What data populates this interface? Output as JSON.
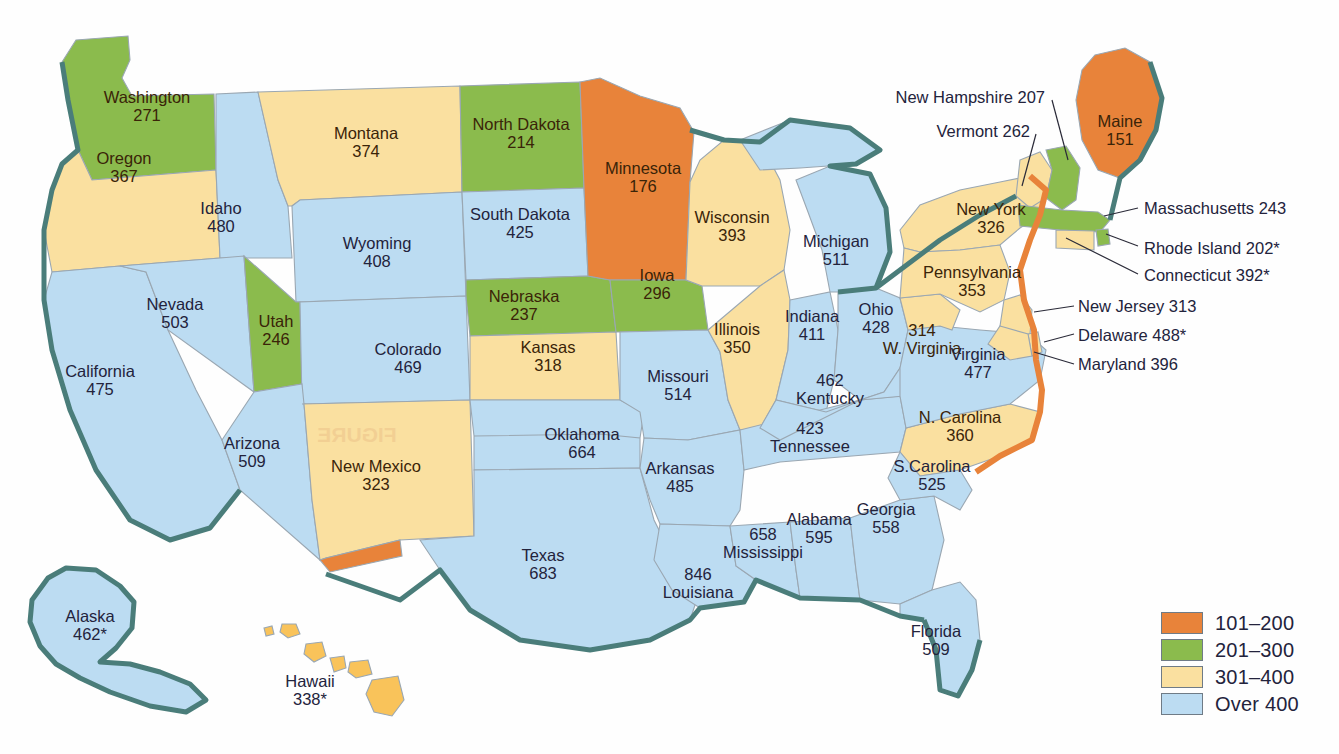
{
  "chart_data": {
    "type": "heatmap",
    "title": "",
    "subtitle": "",
    "map_region": "United States",
    "legend": {
      "position": "bottom-right",
      "bins": [
        {
          "label": "101–200",
          "color": "#e8833a",
          "min": 101,
          "max": 200
        },
        {
          "label": "201–300",
          "color": "#8bbb4d",
          "min": 201,
          "max": 300
        },
        {
          "label": "301–400",
          "color": "#fae0a0",
          "min": 301,
          "max": 400
        },
        {
          "label": "Over 400",
          "color": "#bcdcf2",
          "min": 401,
          "max": null
        }
      ]
    },
    "categories": [
      "Washington",
      "Oregon",
      "Idaho",
      "Montana",
      "North Dakota",
      "Minnesota",
      "Wisconsin",
      "Michigan",
      "South Dakota",
      "Wyoming",
      "Nebraska",
      "Iowa",
      "Illinois",
      "Indiana",
      "Ohio",
      "Nevada",
      "Utah",
      "Colorado",
      "Kansas",
      "Missouri",
      "Kentucky",
      "W. Virginia",
      "Virginia",
      "California",
      "Arizona",
      "New Mexico",
      "Oklahoma",
      "Arkansas",
      "Tennessee",
      "N. Carolina",
      "S.Carolina",
      "Texas",
      "Louisiana",
      "Mississippi",
      "Alabama",
      "Georgia",
      "Florida",
      "New York",
      "Pennsylvania",
      "Maine",
      "Vermont",
      "New Hampshire",
      "Massachusetts",
      "Rhode Island",
      "Connecticut",
      "New Jersey",
      "Delaware",
      "Maryland",
      "Alaska",
      "Hawaii"
    ],
    "values": [
      271,
      367,
      480,
      374,
      214,
      176,
      393,
      511,
      425,
      408,
      237,
      296,
      350,
      411,
      428,
      503,
      246,
      469,
      318,
      514,
      462,
      314,
      477,
      475,
      509,
      323,
      664,
      485,
      423,
      360,
      525,
      683,
      846,
      658,
      595,
      558,
      509,
      326,
      353,
      151,
      262,
      207,
      243,
      202,
      392,
      313,
      488,
      396,
      462,
      338
    ]
  },
  "states": [
    {
      "name": "Washington",
      "value": "271",
      "bin": "201-300",
      "label_x": 147,
      "label_y": 106,
      "dark": true
    },
    {
      "name": "Oregon",
      "value": "367",
      "bin": "301-400",
      "label_x": 124,
      "label_y": 167,
      "dark": true
    },
    {
      "name": "Idaho",
      "value": "480",
      "bin": "over400",
      "label_x": 221,
      "label_y": 217
    },
    {
      "name": "Montana",
      "value": "374",
      "bin": "301-400",
      "label_x": 366,
      "label_y": 142,
      "dark": true
    },
    {
      "name": "North Dakota",
      "value": "214",
      "bin": "201-300",
      "label_x": 521,
      "label_y": 133,
      "dark": true
    },
    {
      "name": "Minnesota",
      "value": "176",
      "bin": "101-200",
      "label_x": 643,
      "label_y": 177,
      "dark": true
    },
    {
      "name": "Wisconsin",
      "value": "393",
      "bin": "301-400",
      "label_x": 732,
      "label_y": 226,
      "dark": true
    },
    {
      "name": "Michigan",
      "value": "511",
      "bin": "over400",
      "label_x": 836,
      "label_y": 250
    },
    {
      "name": "South Dakota",
      "value": "425",
      "bin": "over400",
      "label_x": 520,
      "label_y": 223
    },
    {
      "name": "Wyoming",
      "value": "408",
      "bin": "over400",
      "label_x": 377,
      "label_y": 252
    },
    {
      "name": "Nebraska",
      "value": "237",
      "bin": "201-300",
      "label_x": 524,
      "label_y": 305,
      "dark": true
    },
    {
      "name": "Iowa",
      "value": "296",
      "bin": "201-300",
      "label_x": 657,
      "label_y": 284,
      "dark": true
    },
    {
      "name": "Illinois",
      "value": "350",
      "bin": "301-400",
      "label_x": 737,
      "label_y": 338,
      "dark": true
    },
    {
      "name": "Indiana",
      "value": "411",
      "bin": "over400",
      "label_x": 812,
      "label_y": 325
    },
    {
      "name": "Ohio",
      "value": "428",
      "bin": "over400",
      "label_x": 876,
      "label_y": 318
    },
    {
      "name": "Nevada",
      "value": "503",
      "bin": "over400",
      "label_x": 175,
      "label_y": 313
    },
    {
      "name": "Utah",
      "value": "246",
      "bin": "201-300",
      "label_x": 276,
      "label_y": 330,
      "dark": true
    },
    {
      "name": "Colorado",
      "value": "469",
      "bin": "over400",
      "label_x": 408,
      "label_y": 358
    },
    {
      "name": "Kansas",
      "value": "318",
      "bin": "301-400",
      "label_x": 548,
      "label_y": 356,
      "dark": true
    },
    {
      "name": "Missouri",
      "value": "514",
      "bin": "over400",
      "label_x": 678,
      "label_y": 385
    },
    {
      "name": "California",
      "value": "475",
      "bin": "over400",
      "label_x": 100,
      "label_y": 380
    },
    {
      "name": "Arizona",
      "value": "509",
      "bin": "over400",
      "label_x": 252,
      "label_y": 452
    },
    {
      "name": "New Mexico",
      "value": "323",
      "bin": "301-400",
      "label_x": 376,
      "label_y": 475,
      "dark": true
    },
    {
      "name": "Oklahoma",
      "value": "664",
      "bin": "over400",
      "label_x": 582,
      "label_y": 443
    },
    {
      "name": "Arkansas",
      "value": "485",
      "bin": "over400",
      "label_x": 680,
      "label_y": 477
    },
    {
      "name": "Texas",
      "value": "683",
      "bin": "over400",
      "label_x": 543,
      "label_y": 564
    },
    {
      "name": "Louisiana",
      "value": "846",
      "bin": "over400",
      "label_x": 698,
      "label_y": 583,
      "order": "value-first"
    },
    {
      "name": "Mississippi",
      "value": "658",
      "bin": "over400",
      "label_x": 763,
      "label_y": 543,
      "order": "value-first"
    },
    {
      "name": "Alabama",
      "value": "595",
      "bin": "over400",
      "label_x": 819,
      "label_y": 528
    },
    {
      "name": "Georgia",
      "value": "558",
      "bin": "over400",
      "label_x": 886,
      "label_y": 518
    },
    {
      "name": "Tennessee",
      "value": "423",
      "bin": "over400",
      "label_x": 810,
      "label_y": 437,
      "order": "value-first"
    },
    {
      "name": "Kentucky",
      "value": "462",
      "bin": "over400",
      "label_x": 830,
      "label_y": 389,
      "order": "value-first"
    },
    {
      "name": "W. Virginia",
      "value": "314",
      "bin": "301-400",
      "label_x": 922,
      "label_y": 339,
      "dark": true,
      "order": "value-first"
    },
    {
      "name": "Virginia",
      "value": "477",
      "bin": "over400",
      "label_x": 978,
      "label_y": 363
    },
    {
      "name": "N. Carolina",
      "value": "360",
      "bin": "301-400",
      "label_x": 960,
      "label_y": 426,
      "dark": true
    },
    {
      "name": "S.Carolina",
      "value": "525",
      "bin": "over400",
      "label_x": 932,
      "label_y": 475
    },
    {
      "name": "Florida",
      "value": "509",
      "bin": "over400",
      "label_x": 936,
      "label_y": 640
    },
    {
      "name": "New York",
      "value": "326",
      "bin": "301-400",
      "label_x": 991,
      "label_y": 218,
      "dark": true
    },
    {
      "name": "Pennsylvania",
      "value": "353",
      "bin": "301-400",
      "label_x": 972,
      "label_y": 281,
      "dark": true
    },
    {
      "name": "Maine",
      "value": "151",
      "bin": "101-200",
      "label_x": 1120,
      "label_y": 130,
      "dark": true
    },
    {
      "name": "Alaska",
      "value": "462*",
      "bin": "over400",
      "label_x": 90,
      "label_y": 625
    },
    {
      "name": "Hawaii",
      "value": "338*",
      "bin": "301-400",
      "label_x": 310,
      "label_y": 690
    }
  ],
  "callouts": [
    {
      "name": "New Hampshire",
      "text": "New Hampshire 207",
      "x": 1045,
      "y": 97,
      "align": "right"
    },
    {
      "name": "Vermont",
      "text": "Vermont 262",
      "x": 1030,
      "y": 131,
      "align": "right"
    },
    {
      "name": "Massachusetts",
      "text": "Massachusetts  243",
      "x": 1144,
      "y": 208,
      "align": "left"
    },
    {
      "name": "Rhode Island",
      "text": "Rhode Island  202*",
      "x": 1144,
      "y": 248,
      "align": "left"
    },
    {
      "name": "Connecticut",
      "text": "Connecticut  392*",
      "x": 1144,
      "y": 275,
      "align": "left"
    },
    {
      "name": "New Jersey",
      "text": "New Jersey  313",
      "x": 1078,
      "y": 306,
      "align": "left"
    },
    {
      "name": "Delaware",
      "text": "Delaware  488*",
      "x": 1078,
      "y": 335,
      "align": "left"
    },
    {
      "name": "Maryland",
      "text": "Maryland  396",
      "x": 1078,
      "y": 364,
      "align": "left"
    }
  ],
  "legend_rows": [
    {
      "label": "101–200",
      "cls": "sw-101"
    },
    {
      "label": "201–300",
      "cls": "sw-201"
    },
    {
      "label": "301–400",
      "cls": "sw-301"
    },
    {
      "label": "Over 400",
      "cls": "sw-over"
    }
  ],
  "ghost_text": "FIGURE"
}
